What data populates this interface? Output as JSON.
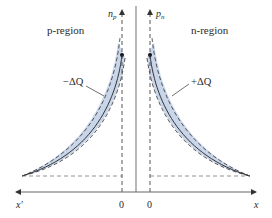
{
  "diagram": {
    "title": "",
    "regions": {
      "left": "p-region",
      "right": "n-region"
    },
    "axes": {
      "left_vertical": {
        "symbol": "n",
        "subscript": "p"
      },
      "right_vertical": {
        "symbol": "p",
        "subscript": "n"
      },
      "left_horizontal": "x′",
      "right_horizontal": "x",
      "left_origin": "0",
      "right_origin": "0"
    },
    "annotations": {
      "left_charge": "−ΔQ",
      "right_charge": "+ΔQ"
    },
    "colors": {
      "band_fill": "#c9d6ea",
      "line": "#2a2a2a",
      "axis": "#555555",
      "junction": "#888888"
    }
  }
}
